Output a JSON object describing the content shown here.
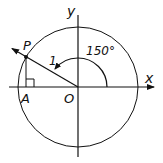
{
  "diagram": {
    "type": "unit-circle",
    "labels": {
      "x_axis": "x",
      "y_axis": "y",
      "origin": "O",
      "point_p": "P",
      "point_a": "A",
      "radius": "1",
      "angle": "150°"
    },
    "angle_degrees": 150,
    "radius_value": 1,
    "colors": {
      "stroke": "#111111",
      "background": "#ffffff"
    }
  }
}
